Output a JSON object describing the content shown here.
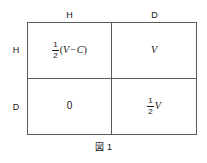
{
  "figure": {
    "caption_label": "図",
    "caption_number": "1",
    "column_headers": [
      "H",
      "D"
    ],
    "row_headers": [
      "H",
      "D"
    ],
    "cells": [
      {
        "row": "H",
        "column": "H",
        "text": "1/2 (V − C)",
        "fraction_numerator": "1",
        "fraction_denominator": "2",
        "expression_open": "(",
        "expression_var1": "V",
        "expression_operator": "−",
        "expression_var2": "C",
        "expression_close": ")"
      },
      {
        "row": "H",
        "column": "D",
        "text": "V",
        "value": "V"
      },
      {
        "row": "D",
        "column": "H",
        "text": "0",
        "value": "0"
      },
      {
        "row": "D",
        "column": "D",
        "text": "1/2 V",
        "fraction_numerator": "1",
        "fraction_denominator": "2",
        "value": "V"
      }
    ],
    "colors": {
      "border": "#5a5a5a",
      "text": "#141414",
      "background": "#ffffff"
    }
  }
}
